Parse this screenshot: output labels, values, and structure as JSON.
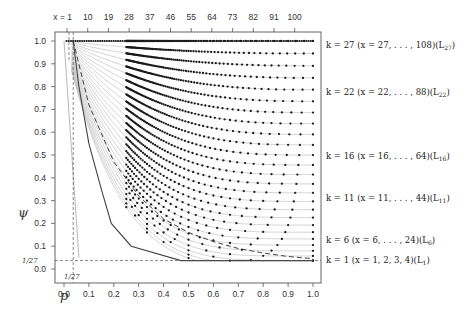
{
  "chart_data": {
    "type": "scatter",
    "title": "",
    "xlabel": "p",
    "ylabel": "ψ",
    "xlim": [
      0.0,
      1.0
    ],
    "ylim": [
      0.0,
      1.0
    ],
    "grid": false,
    "x_ticks": [
      "0.0",
      "0.1",
      "0.2",
      "0.3",
      "0.4",
      "0.5",
      "0.6",
      "0.7",
      "0.8",
      "0.9",
      "1.0"
    ],
    "y_ticks": [
      "0.0",
      "0.1",
      "0.2",
      "0.3",
      "0.4",
      "0.5",
      "0.6",
      "0.7",
      "0.8",
      "0.9",
      "1.0"
    ],
    "top_axis": {
      "label_prefix": "x = ",
      "ticks": [
        "1",
        "10",
        "19",
        "28",
        "37",
        "46",
        "55",
        "64",
        "73",
        "82",
        "91",
        "100"
      ]
    },
    "reference_lines": {
      "vertical_p": 0.037,
      "horizontal_psi": 0.037,
      "x_label": "1/27",
      "y_label": "1/27",
      "style": "dashed"
    },
    "series_description": "For each k = 1..27, points at p = k/x for x = k..4k; grey curve per k; solid dark line = lower envelope; dashed line = boundary curve",
    "k_min": 1,
    "k_max": 27,
    "series": [
      {
        "name": "k = 27 (x = 27, ..., 108)(L27)",
        "k": 27,
        "psi_at_p1": 0.97
      },
      {
        "name": "k = 22 (x = 22, ..., 88)(L22)",
        "k": 22,
        "psi_at_p1": 0.77
      },
      {
        "name": "k = 16 (x = 16, ..., 64)(L16)",
        "k": 16,
        "psi_at_p1": 0.5
      },
      {
        "name": "k = 11 (x = 11, ..., 44)(L11)",
        "k": 11,
        "psi_at_p1": 0.31
      },
      {
        "name": "k = 6 (x = 6, ..., 24)(L6)",
        "k": 6,
        "psi_at_p1": 0.13
      },
      {
        "name": "k = 1 (x = 1, 2, 3, 4)(L1)",
        "k": 1,
        "psi_at_p1": 0.037
      }
    ],
    "envelope_solid": {
      "x": [
        0.037,
        0.06,
        0.1,
        0.15,
        0.19,
        0.27,
        0.47,
        1.0
      ],
      "y": [
        1.0,
        0.8,
        0.55,
        0.35,
        0.2,
        0.1,
        0.037,
        0.037
      ]
    },
    "envelope_dashed": {
      "x": [
        0.037,
        0.1,
        0.2,
        0.3,
        0.4,
        0.5,
        0.6,
        0.7,
        0.8,
        0.9,
        1.0
      ],
      "y": [
        1.0,
        0.72,
        0.47,
        0.32,
        0.22,
        0.16,
        0.12,
        0.09,
        0.07,
        0.055,
        0.045
      ]
    }
  },
  "labels": {
    "x_axis_title": "p",
    "y_axis_title": "ψ",
    "k27": "k = 27 (x = 27, . . . , 108)(L",
    "k27_sub": "27",
    "k22": "k = 22 (x = 22, . . . , 88)(L",
    "k22_sub": "22",
    "k16": "k = 16 (x = 16, . . . , 64)(L",
    "k16_sub": "16",
    "k11": "k = 11 (x = 11, . . . , 44)(L",
    "k11_sub": "11",
    "k6": "k = 6 (x = 6, . . . , 24)(L",
    "k6_sub": "6",
    "k1": "k = 1 (x = 1, 2, 3, 4)(L",
    "k1_sub": "1",
    "close_paren": ")",
    "frac_x": "1/27",
    "frac_y": "1/27"
  },
  "colors": {
    "points": "#1a1a1a",
    "grey_curves": "#b8b8b8",
    "envelope": "#444444",
    "frame": "#555555"
  }
}
